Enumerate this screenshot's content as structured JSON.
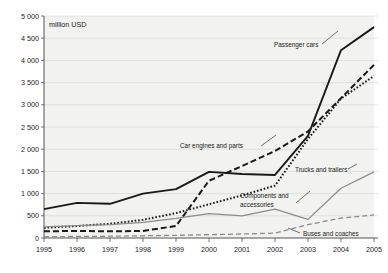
{
  "chart_data": {
    "type": "line",
    "title": "",
    "subtitle": "",
    "xlabel": "",
    "ylabel": "",
    "unit_label": "million USD",
    "x": [
      1995,
      1996,
      1997,
      1998,
      1999,
      2000,
      2001,
      2002,
      2003,
      2004,
      2005
    ],
    "categories": [
      "1995",
      "1996",
      "1997",
      "1998",
      "1999",
      "2000",
      "2001",
      "2002",
      "2003",
      "2004",
      "2005"
    ],
    "xtick_labels": [
      "1995",
      "1996",
      "1997",
      "1998",
      "1999",
      "2000",
      "2001",
      "2002",
      "2003",
      "2004",
      "2005"
    ],
    "ytick_labels": [
      "0",
      "500",
      "1 000",
      "1 500",
      "2 000",
      "2 500",
      "3 000",
      "3 500",
      "4 000",
      "4 500",
      "5 000"
    ],
    "ytick_values": [
      0,
      500,
      1000,
      1500,
      2000,
      2500,
      3000,
      3500,
      4000,
      4500,
      5000
    ],
    "ylim": [
      0,
      5000
    ],
    "xlim": [
      1995,
      2005
    ],
    "grid": true,
    "legend_position": "inline-annotations",
    "series": [
      {
        "name": "Passenger cars",
        "style": "solid",
        "color": "#1a1a1a",
        "values": [
          650,
          790,
          770,
          1000,
          1100,
          1490,
          1440,
          1420,
          2300,
          4230,
          4750
        ]
      },
      {
        "name": "Car engines and parts",
        "style": "dashed",
        "color": "#1a1a1a",
        "values": [
          150,
          160,
          150,
          160,
          270,
          1290,
          1620,
          1960,
          2400,
          3150,
          3900
        ]
      },
      {
        "name": "Components and accessories",
        "style": "dotted",
        "color": "#1a1a1a",
        "values": [
          230,
          270,
          320,
          410,
          560,
          760,
          960,
          1180,
          2230,
          3140,
          3650
        ]
      },
      {
        "name": "Trucks and trailers",
        "style": "solid-light",
        "color": "#8c8c8c",
        "values": [
          250,
          280,
          300,
          350,
          440,
          550,
          500,
          650,
          420,
          1120,
          1490
        ]
      },
      {
        "name": "Buses and coaches",
        "style": "dashed-light",
        "color": "#8c8c8c",
        "values": [
          30,
          35,
          40,
          50,
          60,
          75,
          90,
          110,
          300,
          450,
          520
        ]
      }
    ],
    "annotations": [
      {
        "text": "Passenger cars",
        "series": "Passenger cars"
      },
      {
        "text": "Car engines and parts",
        "series": "Car engines and parts"
      },
      {
        "text": "Trucks and trailers",
        "series": "Trucks and trailers"
      },
      {
        "text": "Components and",
        "series": "Components and accessories"
      },
      {
        "text": "accessories",
        "series": "Components and accessories"
      },
      {
        "text": "Buses and coaches",
        "series": "Buses and coaches"
      }
    ]
  }
}
